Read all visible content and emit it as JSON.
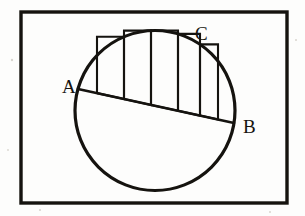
{
  "figure": {
    "kind": "geometry-diagram",
    "background_color": "#fdfdfc",
    "ink_color": "#15130f",
    "canvas": {
      "width": 305,
      "height": 216
    },
    "frame": {
      "name": "outer border rectangle",
      "x": 21,
      "y": 12,
      "width": 266,
      "height": 191,
      "stroke_width": 3.4
    },
    "circle": {
      "name": "circle",
      "cx": 155,
      "cy": 110.5,
      "r": 80,
      "stroke_width": 3.2
    },
    "chord": {
      "name": "chord AB",
      "x1": 78,
      "y1": 89,
      "x2": 234,
      "y2": 123,
      "stroke_width": 2.7
    },
    "labels": [
      {
        "id": "A",
        "text": "A",
        "x": 62,
        "y": 93,
        "anchor": "chord left endpoint"
      },
      {
        "id": "B",
        "text": "B",
        "x": 243,
        "y": 133,
        "anchor": "chord right endpoint"
      },
      {
        "id": "C",
        "text": "C",
        "x": 195,
        "y": 40,
        "anchor": "point on upper arc"
      }
    ],
    "bars": {
      "name": "inscribed rectangles in circular segment",
      "count": 5,
      "orientation": "vertical sides, horizontal bases resting on chord",
      "stroke_width": 2.1,
      "items": [
        {
          "index": 1,
          "left": 97,
          "right": 124,
          "base_y_left": 93,
          "base_y_right": 99,
          "top_y": 63
        },
        {
          "index": 2,
          "left": 124,
          "right": 151,
          "base_y_left": 99,
          "base_y_right": 105,
          "top_y": 47
        },
        {
          "index": 3,
          "left": 151,
          "right": 178,
          "base_y_left": 105,
          "base_y_right": 111,
          "top_y": 38
        },
        {
          "index": 4,
          "left": 178,
          "right": 200,
          "base_y_left": 111,
          "base_y_right": 116,
          "top_y": 39
        },
        {
          "index": 5,
          "left": 200,
          "right": 218,
          "base_y_left": 116,
          "base_y_right": 120,
          "top_y": 50
        }
      ]
    },
    "specks": [
      {
        "x": 12,
        "y": 60,
        "r": 1.2
      },
      {
        "x": 296,
        "y": 40,
        "r": 1.0
      },
      {
        "x": 40,
        "y": 210,
        "r": 1.1
      },
      {
        "x": 270,
        "y": 212,
        "r": 1.0
      },
      {
        "x": 8,
        "y": 150,
        "r": 0.9
      }
    ]
  }
}
